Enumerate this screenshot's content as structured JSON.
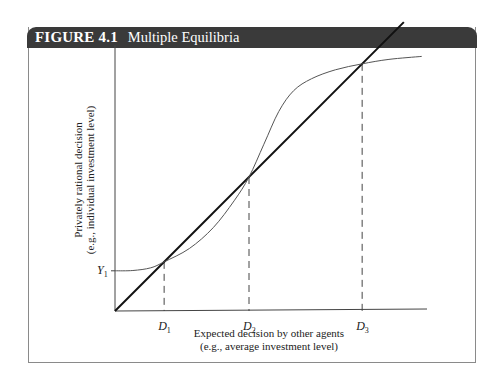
{
  "figure": {
    "label": "FIGURE 4.1",
    "title": "Multiple Equilibria"
  },
  "chart_data": {
    "type": "line",
    "title": "Multiple Equilibria",
    "xlabel_lines": [
      "Expected decision by other agents",
      "(e.g., average investment level)"
    ],
    "ylabel_lines": [
      "Privately rational decision",
      "(e.g., individual investment level)"
    ],
    "x_ticks": [
      {
        "base": "D",
        "sub": "1",
        "x": 0.165
      },
      {
        "base": "D",
        "sub": "2",
        "x": 0.45
      },
      {
        "base": "D",
        "sub": "3",
        "x": 0.83
      }
    ],
    "y_ticks": [
      {
        "base": "Y",
        "sub": "1",
        "y": 0.135
      }
    ],
    "xlim": [
      0,
      1.05
    ],
    "ylim": [
      0,
      0.9
    ],
    "grid": false,
    "legend": "none",
    "series": [
      {
        "name": "45-degree line",
        "style": "solid-thick",
        "points": [
          [
            0,
            0
          ],
          [
            0.97,
            0.97
          ]
        ]
      },
      {
        "name": "Best-response curve",
        "style": "solid-thin",
        "points": [
          [
            0,
            0.135
          ],
          [
            0.06,
            0.136
          ],
          [
            0.12,
            0.145
          ],
          [
            0.165,
            0.165
          ],
          [
            0.25,
            0.21
          ],
          [
            0.33,
            0.28
          ],
          [
            0.4,
            0.37
          ],
          [
            0.45,
            0.45
          ],
          [
            0.5,
            0.56
          ],
          [
            0.55,
            0.67
          ],
          [
            0.6,
            0.74
          ],
          [
            0.66,
            0.78
          ],
          [
            0.74,
            0.81
          ],
          [
            0.83,
            0.83
          ],
          [
            0.92,
            0.845
          ],
          [
            1.03,
            0.855
          ]
        ]
      }
    ],
    "annotations": [
      {
        "type": "dashed-drop-line",
        "x": 0.165,
        "y": 0.165
      },
      {
        "type": "dashed-drop-line",
        "x": 0.45,
        "y": 0.45
      },
      {
        "type": "dashed-drop-line",
        "x": 0.83,
        "y": 0.83
      }
    ]
  }
}
